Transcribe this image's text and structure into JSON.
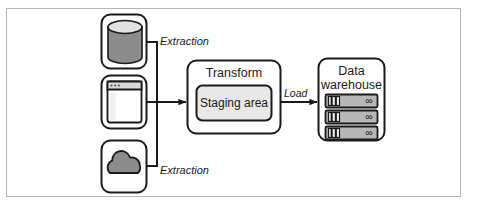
{
  "figure": {
    "background_color": "#ffffff",
    "frame_color": "#b4b4b4",
    "stroke_color": "#1a1a1a",
    "fill_light": "#f2f2f2",
    "fill_mid": "#8c8c8c",
    "fill_pale": "#e8e8e8"
  },
  "sources": [
    {
      "id": "database",
      "icon": "database-cylinder-icon",
      "shape": "rounded-square",
      "fill": "#8c8c8c"
    },
    {
      "id": "application",
      "icon": "application-window-icon",
      "shape": "rounded-square",
      "fill": "#ffffff"
    },
    {
      "id": "cloud",
      "icon": "cloud-icon",
      "shape": "rounded-square",
      "fill": "#8c8c8c"
    }
  ],
  "edges": {
    "extraction_top_label": "Extraction",
    "extraction_bottom_label": "Extraction",
    "load_label": "Load"
  },
  "transform": {
    "title": "Transform",
    "staging_label": "Staging area"
  },
  "warehouse": {
    "title_line1": "Data",
    "title_line2": "warehouse",
    "units": [
      {
        "indicator": "∞"
      },
      {
        "indicator": "∞"
      },
      {
        "indicator": "∞"
      }
    ]
  }
}
